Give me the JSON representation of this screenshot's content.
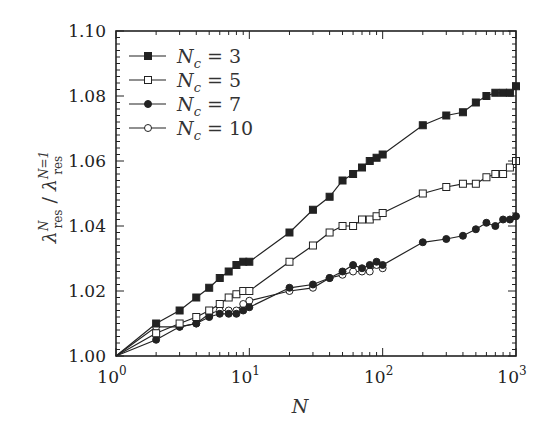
{
  "chart_data": {
    "type": "line",
    "title": "",
    "xlabel": "N",
    "ylabel": "λ_res^N / λ_res^{N=1}",
    "xscale": "log",
    "xlim": [
      1,
      1000
    ],
    "ylim": [
      1.0,
      1.1
    ],
    "xticks": [
      "10^0",
      "10^1",
      "10^2",
      "10^3"
    ],
    "yticks": [
      "1.00",
      "1.02",
      "1.04",
      "1.06",
      "1.08",
      "1.10"
    ],
    "grid": false,
    "legend_position": "upper left",
    "series": [
      {
        "name": "N_c = 3",
        "marker": "filled-square",
        "x": [
          1,
          2,
          3,
          4,
          5,
          6,
          7,
          8,
          9,
          10,
          20,
          30,
          40,
          50,
          60,
          70,
          80,
          90,
          100,
          200,
          300,
          400,
          500,
          600,
          700,
          800,
          900,
          1000
        ],
        "y": [
          1.0,
          1.01,
          1.014,
          1.018,
          1.021,
          1.024,
          1.026,
          1.028,
          1.029,
          1.029,
          1.038,
          1.045,
          1.049,
          1.054,
          1.056,
          1.058,
          1.06,
          1.061,
          1.062,
          1.071,
          1.074,
          1.075,
          1.078,
          1.08,
          1.081,
          1.081,
          1.081,
          1.083
        ]
      },
      {
        "name": "N_c = 5",
        "marker": "open-square",
        "x": [
          1,
          2,
          3,
          4,
          5,
          6,
          7,
          8,
          9,
          10,
          20,
          30,
          40,
          50,
          60,
          70,
          80,
          90,
          100,
          200,
          300,
          400,
          500,
          600,
          700,
          800,
          900,
          1000
        ],
        "y": [
          1.0,
          1.007,
          1.01,
          1.012,
          1.014,
          1.016,
          1.018,
          1.019,
          1.02,
          1.02,
          1.029,
          1.034,
          1.038,
          1.04,
          1.04,
          1.042,
          1.042,
          1.043,
          1.044,
          1.05,
          1.052,
          1.053,
          1.053,
          1.055,
          1.056,
          1.056,
          1.058,
          1.06
        ]
      },
      {
        "name": "N_c = 7",
        "marker": "filled-circle",
        "x": [
          1,
          2,
          3,
          4,
          5,
          6,
          7,
          8,
          9,
          10,
          20,
          30,
          40,
          50,
          60,
          70,
          80,
          90,
          100,
          200,
          300,
          400,
          500,
          600,
          700,
          800,
          900,
          1000
        ],
        "y": [
          1.0,
          1.005,
          1.009,
          1.01,
          1.012,
          1.013,
          1.013,
          1.013,
          1.014,
          1.015,
          1.021,
          1.022,
          1.024,
          1.026,
          1.028,
          1.027,
          1.028,
          1.029,
          1.028,
          1.035,
          1.036,
          1.037,
          1.039,
          1.041,
          1.04,
          1.042,
          1.042,
          1.043
        ]
      },
      {
        "name": "N_c = 10",
        "marker": "open-circle",
        "x": [
          1,
          2,
          3,
          4,
          5,
          6,
          7,
          8,
          9,
          10,
          20,
          30,
          40,
          50,
          60,
          70,
          80,
          90,
          100
        ],
        "y": [
          1.0,
          1.009,
          1.009,
          1.01,
          1.013,
          1.014,
          1.014,
          1.014,
          1.016,
          1.017,
          1.02,
          1.021,
          1.024,
          1.025,
          1.026,
          1.026,
          1.026,
          1.028,
          1.027
        ]
      }
    ]
  },
  "legend": {
    "items": [
      {
        "label": "N_c = 3",
        "sub": "c",
        "value": "3"
      },
      {
        "label": "N_c = 5",
        "sub": "c",
        "value": "5"
      },
      {
        "label": "N_c = 7",
        "sub": "c",
        "value": "7"
      },
      {
        "label": "N_c = 10",
        "sub": "c",
        "value": "10"
      }
    ]
  },
  "axes": {
    "x_title": "N",
    "y_title_main": "λ",
    "y_title_sup": "N",
    "y_title_sub": "res",
    "y_title_den_sup": "N=1",
    "x_tick_base": "10",
    "x_tick_exps": [
      "0",
      "1",
      "2",
      "3"
    ],
    "y_tick_labels": [
      "1.00",
      "1.02",
      "1.04",
      "1.06",
      "1.08",
      "1.10"
    ]
  }
}
